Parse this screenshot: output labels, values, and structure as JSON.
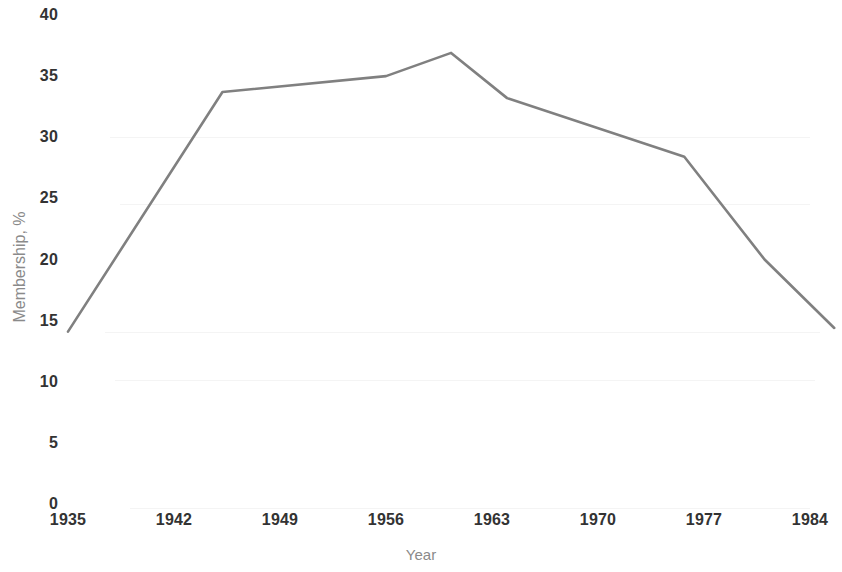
{
  "chart_data": {
    "type": "line",
    "title": "",
    "xlabel": "Year",
    "ylabel": "Membership, %",
    "xlim": [
      1935,
      1986
    ],
    "ylim": [
      0,
      40
    ],
    "grid": false,
    "legend": "none",
    "line_color": "#808080",
    "x_ticks": [
      1935,
      1942,
      1949,
      1956,
      1963,
      1970,
      1977,
      1984
    ],
    "x_tick_labels": [
      "1935",
      "1942",
      "1949",
      "1956",
      "1963",
      "1970",
      "1977",
      "1984"
    ],
    "y_ticks": [
      0,
      5,
      10,
      15,
      20,
      25,
      30,
      35,
      40
    ],
    "y_tick_labels": [
      "0",
      "5",
      "10",
      "15",
      "20",
      "25",
      "30",
      "35",
      "40"
    ],
    "series": [
      {
        "name": "Membership",
        "x": [
          1935.0,
          1945.2,
          1956.0,
          1960.3,
          1964.0,
          1975.7,
          1981.0,
          1985.6
        ],
        "values": [
          14.1,
          33.7,
          35.0,
          36.9,
          33.2,
          28.4,
          20.0,
          14.4
        ]
      }
    ]
  },
  "axes": {
    "y_title": "Membership, %",
    "x_title": "Year"
  }
}
